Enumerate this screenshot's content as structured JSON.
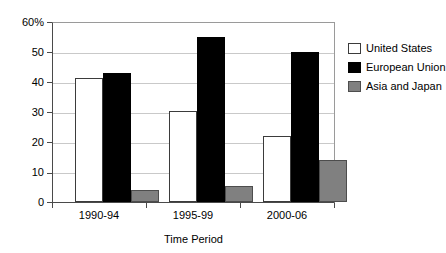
{
  "chart_data": {
    "type": "bar",
    "title": "",
    "xlabel": "Time Period",
    "ylabel": "",
    "categories": [
      "1990-94",
      "1995-99",
      "2000-06"
    ],
    "series": [
      {
        "name": "United States",
        "color": "#ffffff",
        "values": [
          41.5,
          30.4,
          22.2
        ]
      },
      {
        "name": "European Union",
        "color": "#000000",
        "values": [
          43.3,
          55.3,
          50.2
        ]
      },
      {
        "name": "Asia and Japan",
        "color": "#808080",
        "values": [
          4.0,
          5.5,
          14.0
        ]
      }
    ],
    "ylim": [
      0,
      60
    ],
    "yticks": [
      0,
      10,
      20,
      30,
      40,
      50,
      60
    ],
    "ytick_labels": [
      "0",
      "10",
      "20",
      "30",
      "40",
      "50",
      "60%"
    ],
    "grid": true,
    "legend_position": "right"
  },
  "legend": {
    "items": [
      {
        "label": "United States"
      },
      {
        "label": "European Union"
      },
      {
        "label": "Asia and Japan"
      }
    ]
  },
  "axis": {
    "x_title": "Time Period"
  }
}
